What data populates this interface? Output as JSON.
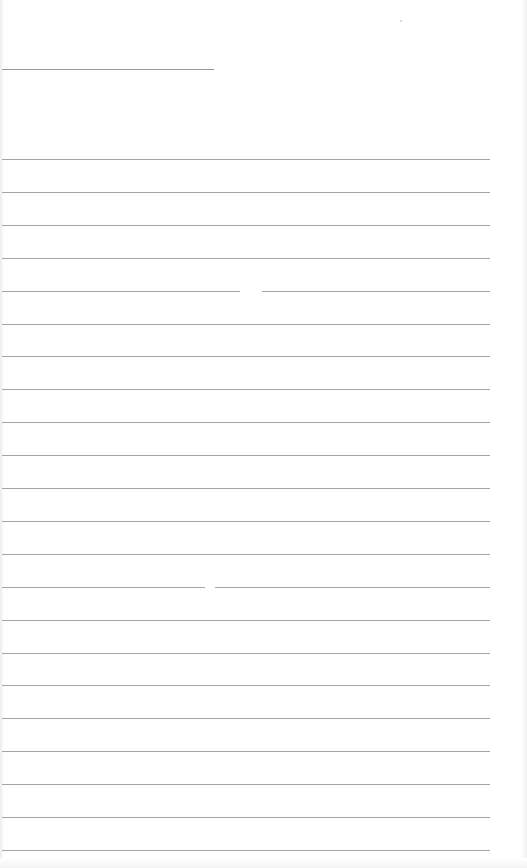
{
  "document": {
    "type": "ruled-notepad-page",
    "header_line": {
      "top": 69,
      "left": 2,
      "width": 212
    },
    "rule_count": 22,
    "rule_start_top": 159,
    "rule_spacing": 32.9,
    "rule_left": 2,
    "rule_width": 488,
    "rule_color": "#a6a6a6",
    "background_color": "#ffffff",
    "rules_with_gaps": [
      {
        "index": 4,
        "gap_left": 240,
        "gap_width": 22
      },
      {
        "index": 13,
        "gap_left": 205,
        "gap_width": 10
      }
    ],
    "text_content": []
  }
}
